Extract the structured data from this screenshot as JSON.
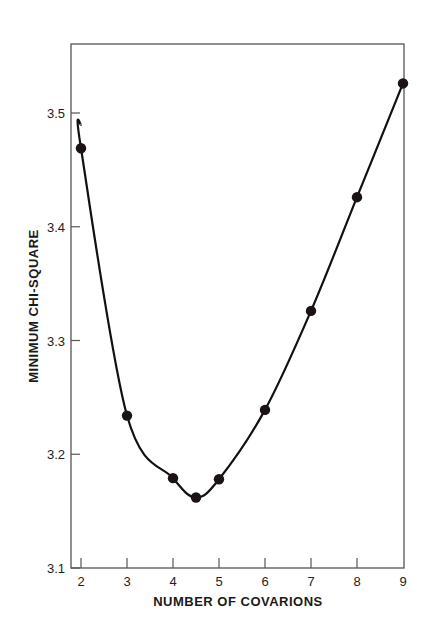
{
  "chart_data": {
    "type": "line",
    "title": "",
    "xlabel": "NUMBER OF COVARIONS",
    "ylabel": "MINIMUM CHI-SQUARE",
    "xlim": [
      2,
      9
    ],
    "ylim": [
      3.1,
      3.56
    ],
    "x_ticks": [
      "2",
      "3",
      "4",
      "5",
      "6",
      "7",
      "8",
      "9"
    ],
    "y_ticks": [
      "3.1",
      "3.2",
      "3.3",
      "3.4",
      "3.5"
    ],
    "grid": false,
    "legend": null,
    "series": [
      {
        "name": "Minimum chi-square",
        "markers": true,
        "smooth_curve": true,
        "points": [
          {
            "x": 2,
            "y": 3.469
          },
          {
            "x": 3,
            "y": 3.234
          },
          {
            "x": 4,
            "y": 3.179
          },
          {
            "x": 4.5,
            "y": 3.162
          },
          {
            "x": 5,
            "y": 3.178
          },
          {
            "x": 6,
            "y": 3.239
          },
          {
            "x": 7,
            "y": 3.326
          },
          {
            "x": 8,
            "y": 3.426
          },
          {
            "x": 9,
            "y": 3.526
          }
        ],
        "curve_start": {
          "x": 2,
          "y": 3.49
        }
      }
    ],
    "colors": {
      "line": "#111111",
      "marker": "#1a1214",
      "frame": "#555555"
    }
  }
}
